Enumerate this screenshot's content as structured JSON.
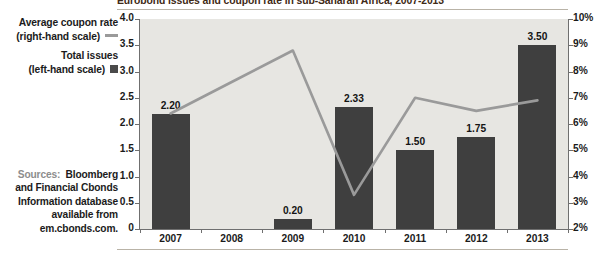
{
  "title": "Eurobond issues and coupon rate in sub-Saharan Africa, 2007-2013",
  "legend": {
    "series_line_label_1": "Average coupon rate",
    "series_line_label_2": "(right-hand scale)",
    "series_bar_label_1": "Total issues",
    "series_bar_label_2": "(left-hand scale)",
    "line_key": "line-key",
    "bar_key": "square-key"
  },
  "sources": {
    "line1_label": "Sources:",
    "line1_value": "Bloomberg",
    "line2": "and Financial Cbonds",
    "line3": "Information database",
    "line4": "available from",
    "line5": "em.cbonds.com."
  },
  "colors": {
    "bar": "#3f3f3f",
    "line": "#9a9a9a",
    "plot_background": "#e7e6e2",
    "axis": "#6f6f6f",
    "title_text": "#3f2a16",
    "rule": "#b9b3a7"
  },
  "chart_data": {
    "type": "bar",
    "title": "Eurobond issues and coupon rate in sub-Saharan Africa, 2007-2013",
    "xlabel": "",
    "categories": [
      "2007",
      "2008",
      "2009",
      "2010",
      "2011",
      "2012",
      "2013"
    ],
    "grid": false,
    "legend_position": "left",
    "series": [
      {
        "name": "Total issues (left-hand scale)",
        "type": "bar",
        "axis": "left",
        "values": [
          2.2,
          0,
          0.2,
          2.33,
          1.5,
          1.75,
          3.5
        ],
        "labels": [
          "2.20",
          "",
          "0.20",
          "2.33",
          "1.50",
          "1.75",
          "3.50"
        ]
      },
      {
        "name": "Average coupon rate (right-hand scale)",
        "type": "line",
        "axis": "right",
        "values": [
          6.4,
          7.6,
          8.8,
          3.3,
          7.0,
          6.5,
          6.9
        ]
      }
    ],
    "left_axis": {
      "label": "",
      "ylim": [
        0,
        4.0
      ],
      "ticks": [
        0,
        0.5,
        1.0,
        1.5,
        2.0,
        2.5,
        3.0,
        3.5,
        4.0
      ],
      "tick_labels": [
        "0",
        "0.5",
        "1.0",
        "1.5",
        "2.0",
        "2.5",
        "3.0",
        "3.5",
        "4.0"
      ]
    },
    "right_axis": {
      "label": "",
      "ylim": [
        2,
        10
      ],
      "ticks": [
        2,
        3,
        4,
        5,
        6,
        7,
        8,
        9,
        10
      ],
      "tick_labels": [
        "2%",
        "3%",
        "4%",
        "5%",
        "6%",
        "7%",
        "8%",
        "9%",
        "10%"
      ]
    }
  }
}
